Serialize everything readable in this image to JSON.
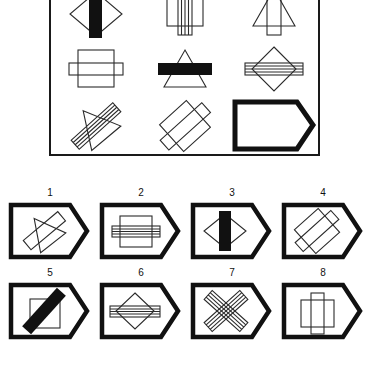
{
  "puzzle": {
    "type": "visual-analogy-matrix",
    "matrix": {
      "rows": 3,
      "columns": 3,
      "cells": [
        {
          "position": 1,
          "name": "matrix-cell-1",
          "shapes": [
            "diamond-outline",
            "vertical-bar-black"
          ],
          "description": "Diamond outline with solid black vertical bar"
        },
        {
          "position": 2,
          "name": "matrix-cell-2",
          "shapes": [
            "square-outline",
            "vertical-rectangle-striped"
          ],
          "description": "Square outline with striped vertical rectangle"
        },
        {
          "position": 3,
          "name": "matrix-cell-3",
          "shapes": [
            "triangle-outline",
            "vertical-rectangle-outline"
          ],
          "description": "Triangle outline with vertical rectangle"
        },
        {
          "position": 4,
          "name": "matrix-cell-4",
          "shapes": [
            "square-outline",
            "horizontal-rectangle-outline"
          ],
          "description": "Square outline with horizontal rectangle"
        },
        {
          "position": 5,
          "name": "matrix-cell-5",
          "shapes": [
            "triangle-outline",
            "horizontal-bar-black"
          ],
          "description": "Triangle outline with solid black horizontal bar"
        },
        {
          "position": 6,
          "name": "matrix-cell-6",
          "shapes": [
            "diamond-outline",
            "horizontal-rectangle-striped"
          ],
          "description": "Diamond outline with striped horizontal rectangle"
        },
        {
          "position": 7,
          "name": "matrix-cell-7",
          "shapes": [
            "triangle-rotated",
            "rectangle-rotated-striped"
          ],
          "description": "Rotated triangle with rotated striped rectangle"
        },
        {
          "position": 8,
          "name": "matrix-cell-8",
          "shapes": [
            "square-rotated",
            "rectangle-rotated-outline"
          ],
          "description": "Rotated square with rotated rectangle"
        },
        {
          "position": 9,
          "name": "matrix-cell-9-missing",
          "shapes": [
            "tag-pentagon-blank"
          ],
          "description": "Missing piece - blank tag shape"
        }
      ]
    },
    "options": [
      {
        "number": "1",
        "name": "option-1",
        "shapes": [
          "triangle-rotated",
          "rectangle-rotated-outline"
        ],
        "description": "Rotated triangle with rotated rectangle"
      },
      {
        "number": "2",
        "name": "option-2",
        "shapes": [
          "square-outline",
          "horizontal-rectangle-striped"
        ],
        "description": "Square with striped horizontal rectangle"
      },
      {
        "number": "3",
        "name": "option-3",
        "shapes": [
          "diamond-outline",
          "vertical-bar-black"
        ],
        "description": "Diamond with solid black vertical bar"
      },
      {
        "number": "4",
        "name": "option-4",
        "shapes": [
          "square-rotated",
          "rectangle-rotated-outline"
        ],
        "description": "Rotated square with rotated rectangle"
      },
      {
        "number": "5",
        "name": "option-5",
        "shapes": [
          "square-outline",
          "diagonal-bar-black"
        ],
        "description": "Square with solid black diagonal bar"
      },
      {
        "number": "6",
        "name": "option-6",
        "shapes": [
          "diamond-outline",
          "horizontal-rectangle-striped"
        ],
        "description": "Diamond with striped horizontal rectangle"
      },
      {
        "number": "7",
        "name": "option-7",
        "shapes": [
          "rectangle-rotated-striped",
          "rectangle-rotated-striped-crossed"
        ],
        "description": "Two crossed rotated striped rectangles"
      },
      {
        "number": "8",
        "name": "option-8",
        "shapes": [
          "square-outline",
          "vertical-rectangle-outline"
        ],
        "description": "Square with vertical rectangle"
      }
    ]
  },
  "colors": {
    "ink": "#111111",
    "line": "#2b2b2b",
    "background": "#ffffff"
  },
  "caption": ""
}
